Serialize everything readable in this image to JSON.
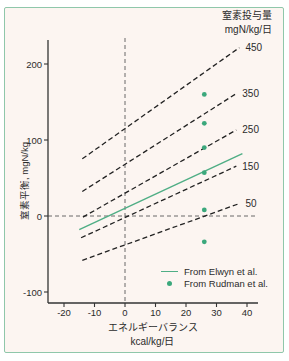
{
  "chart": {
    "right_axis_title_line1": "窒素投与量",
    "right_axis_title_line2": "mgN/kg/日",
    "ylabel": "窒素平衡,  mgN/kg",
    "xlabel_line1": "エネルギーバランス",
    "xlabel_line2": "kcal/kg/日",
    "legend": [
      {
        "marker": "line",
        "label": "From Elwyn et al."
      },
      {
        "marker": "dot",
        "label": "From Rudman et al."
      }
    ]
  },
  "chart_data": {
    "type": "line",
    "title": "窒素投与量 mgN/kg/日",
    "xlabel": "エネルギーバランス kcal/kg/日",
    "ylabel": "窒素平衡, mgN/kg",
    "xlim": [
      -25,
      43
    ],
    "ylim": [
      -114,
      230
    ],
    "xticks": [
      -20,
      -10,
      0,
      10,
      20,
      30,
      40
    ],
    "yticks": [
      200,
      100,
      0,
      -100
    ],
    "grid": false,
    "zero_reference_lines": {
      "vertical_at_x": 0,
      "horizontal_at_y": 0
    },
    "series": [
      {
        "name": "N intake 450",
        "style": "dashed",
        "label": "450",
        "intercept": 115,
        "slope": 2.84,
        "x_range": [
          -14,
          37.5
        ]
      },
      {
        "name": "N intake 350",
        "style": "dashed",
        "label": "350",
        "intercept": 68,
        "slope": 2.55,
        "x_range": [
          -14,
          36.5
        ]
      },
      {
        "name": "N intake 250",
        "style": "dashed",
        "label": "250",
        "intercept": 30,
        "slope": 2.28,
        "x_range": [
          -13.8,
          36.5
        ]
      },
      {
        "name": "N intake 150",
        "style": "dashed",
        "label": "150",
        "intercept": -2,
        "slope": 1.85,
        "x_range": [
          -14.4,
          36.5
        ]
      },
      {
        "name": "N intake 50",
        "style": "dashed",
        "label": "50",
        "intercept": -38,
        "slope": 1.45,
        "x_range": [
          -14,
          37.5
        ]
      }
    ],
    "elwyn_line": {
      "name": "From Elwyn et al.",
      "style": "solid-green",
      "intercept": 10,
      "slope": 1.87,
      "x_range": [
        -15,
        38.5
      ]
    },
    "rudman_points": {
      "name": "From Rudman et al.",
      "x": 26,
      "values": [
        160,
        122,
        90,
        57,
        8,
        -34
      ]
    },
    "legend_position": "lower-right"
  },
  "colors": {
    "accent_green": "#4fae85",
    "dot_green": "#3ba87c",
    "border_green": "#8fc7aa",
    "card_background": "#fcf5f1",
    "line_black": "#222222",
    "zero_dash_gray": "#5a5a5a",
    "text": "#2b2b2b"
  }
}
